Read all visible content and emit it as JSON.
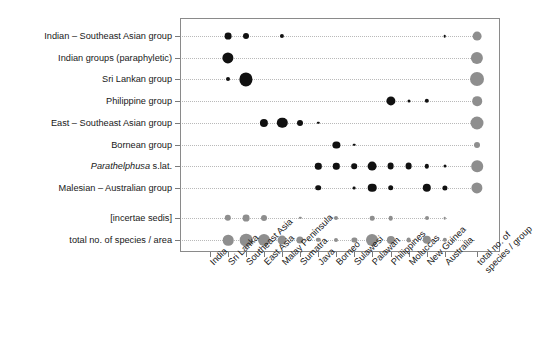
{
  "chart_data": {
    "type": "heatmap",
    "title": "",
    "xlabel": "",
    "ylabel": "",
    "legend_position": "none",
    "grid": true,
    "note": "Bubble (dot) matrix: dot area encodes number of species of each Parathelphusidae group per geographic area. Dark dots = group x area counts; grey dots = marginal totals (rightmost column 'total no. of species / group' and bottom row 'total no. of species / area').",
    "categories": [
      "India",
      "Sri Lanka",
      "Southeast Asia",
      "East Asia",
      "Malay Peninsula",
      "Sumatra",
      "Java",
      "Borneo",
      "Sulawesi",
      "Palawan",
      "Philippines",
      "Moluccas",
      "New Guinea",
      "Australia",
      "total no. of species / group"
    ],
    "rows": [
      "Indian – Southeast Asian group",
      "Indian groups (paraphyletic)",
      "Sri Lankan group",
      "Philippine group",
      "East – Southeast Asian group",
      "Bornean group",
      "Parathelphusa s.lat.",
      "Malesian – Australian group",
      "[incertae sedis]",
      "total no. of species / area"
    ],
    "row_labels_styled": [
      {
        "text": "Indian – Southeast Asian group",
        "italic_prefix": ""
      },
      {
        "text": "Indian groups (paraphyletic)",
        "italic_prefix": ""
      },
      {
        "text": "Sri Lankan group",
        "italic_prefix": ""
      },
      {
        "text": "Philippine group",
        "italic_prefix": ""
      },
      {
        "text": "East – Southeast Asian group",
        "italic_prefix": ""
      },
      {
        "text": "Bornean group",
        "italic_prefix": ""
      },
      {
        "text": "s.lat.",
        "italic_prefix": "Parathelphusa"
      },
      {
        "text": "Malesian – Australian group",
        "italic_prefix": ""
      },
      {
        "text": "[incertae sedis]",
        "italic_prefix": ""
      },
      {
        "text": "total no. of species / area",
        "italic_prefix": ""
      }
    ],
    "series": [
      {
        "name": "Indian – Southeast Asian group",
        "values": [
          0,
          5,
          4,
          0,
          2,
          0,
          0,
          0,
          0,
          0,
          0,
          0,
          0,
          1,
          11
        ]
      },
      {
        "name": "Indian groups (paraphyletic)",
        "values": [
          0,
          12,
          0,
          0,
          0,
          0,
          0,
          0,
          0,
          0,
          0,
          0,
          0,
          0,
          19
        ]
      },
      {
        "name": "Sri Lankan group",
        "values": [
          0,
          2,
          20,
          0,
          0,
          0,
          0,
          0,
          0,
          0,
          0,
          0,
          0,
          0,
          25
        ]
      },
      {
        "name": "Philippine group",
        "values": [
          0,
          0,
          0,
          0,
          0,
          0,
          0,
          0,
          0,
          0,
          11,
          1,
          2,
          0,
          13
        ]
      },
      {
        "name": "East – Southeast Asian group",
        "values": [
          0,
          0,
          0,
          8,
          14,
          4,
          1,
          0,
          0,
          0,
          0,
          0,
          0,
          0,
          22
        ]
      },
      {
        "name": "Bornean group",
        "values": [
          0,
          0,
          0,
          0,
          0,
          0,
          0,
          6,
          1,
          0,
          0,
          0,
          0,
          0,
          5
        ]
      },
      {
        "name": "Parathelphusa s.lat.",
        "values": [
          0,
          0,
          0,
          0,
          0,
          0,
          5,
          5,
          4,
          9,
          6,
          6,
          2,
          1,
          18
        ]
      },
      {
        "name": "Malesian – Australian group",
        "values": [
          0,
          0,
          0,
          0,
          0,
          0,
          4,
          0,
          1,
          6,
          1,
          0,
          10,
          3,
          17
        ]
      },
      {
        "name": "[incertae sedis]",
        "values": [
          0,
          3,
          4,
          3,
          0,
          0,
          0,
          1,
          0,
          2,
          2,
          0,
          2,
          1,
          0
        ]
      },
      {
        "name": "total no. of species / area",
        "values": [
          0,
          11,
          15,
          13,
          8,
          5,
          2,
          2,
          3,
          14,
          9,
          5,
          2,
          8,
          0
        ]
      }
    ],
    "bottom_row_extra": {
      "Borneo_overall": 18,
      "Sulawesi_overall": 7
    },
    "colors": {
      "dark_dot": "#111111",
      "gray_dot": "#8e8e8e",
      "frame": "#8a8a8a",
      "grid": "#b9b9b9",
      "text": "#181818",
      "background": "#ffffff"
    }
  },
  "axis": {
    "column_labels": [
      "India",
      "Sri Lanka",
      "Southeast Asia",
      "East Asia",
      "Malay Peninsula",
      "Sumatra",
      "Java",
      "Borneo",
      "Sulawesi",
      "Palawan",
      "Philippines",
      "Moluccas",
      "New Guinea",
      "Australia"
    ],
    "total_column_label_line1": "total no. of",
    "total_column_label_line2": "species / group"
  },
  "plot_points": {
    "dark": [
      {
        "row": 0,
        "col": 1,
        "r": 3.4
      },
      {
        "row": 0,
        "col": 2,
        "r": 3.0
      },
      {
        "row": 0,
        "col": 4,
        "r": 2.1
      },
      {
        "row": 0,
        "col": 13,
        "r": 1.3
      },
      {
        "row": 1,
        "col": 1,
        "r": 5.6
      },
      {
        "row": 2,
        "col": 1,
        "r": 2.0
      },
      {
        "row": 2,
        "col": 2,
        "r": 6.6
      },
      {
        "row": 3,
        "col": 10,
        "r": 4.6
      },
      {
        "row": 3,
        "col": 11,
        "r": 1.5
      },
      {
        "row": 3,
        "col": 12,
        "r": 2.2
      },
      {
        "row": 4,
        "col": 3,
        "r": 4.1
      },
      {
        "row": 4,
        "col": 4,
        "r": 5.2
      },
      {
        "row": 4,
        "col": 5,
        "r": 3.0
      },
      {
        "row": 4,
        "col": 6,
        "r": 1.2
      },
      {
        "row": 5,
        "col": 7,
        "r": 3.6
      },
      {
        "row": 5,
        "col": 8,
        "r": 1.3
      },
      {
        "row": 6,
        "col": 6,
        "r": 3.2
      },
      {
        "row": 6,
        "col": 7,
        "r": 3.2
      },
      {
        "row": 6,
        "col": 8,
        "r": 2.8
      },
      {
        "row": 6,
        "col": 9,
        "r": 4.4
      },
      {
        "row": 6,
        "col": 10,
        "r": 3.4
      },
      {
        "row": 6,
        "col": 11,
        "r": 3.4
      },
      {
        "row": 6,
        "col": 12,
        "r": 2.2
      },
      {
        "row": 6,
        "col": 13,
        "r": 1.5
      },
      {
        "row": 7,
        "col": 6,
        "r": 2.8
      },
      {
        "row": 7,
        "col": 8,
        "r": 1.4
      },
      {
        "row": 7,
        "col": 9,
        "r": 4.3
      },
      {
        "row": 7,
        "col": 10,
        "r": 2.8
      },
      {
        "row": 7,
        "col": 12,
        "r": 4.2
      },
      {
        "row": 7,
        "col": 13,
        "r": 2.6
      }
    ],
    "gray": [
      {
        "row": 0,
        "col": 14,
        "r": 4.4
      },
      {
        "row": 1,
        "col": 14,
        "r": 6.1
      },
      {
        "row": 2,
        "col": 14,
        "r": 7.0
      },
      {
        "row": 3,
        "col": 14,
        "r": 4.8
      },
      {
        "row": 4,
        "col": 14,
        "r": 6.5
      },
      {
        "row": 5,
        "col": 14,
        "r": 3.0
      },
      {
        "row": 6,
        "col": 14,
        "r": 5.8
      },
      {
        "row": 7,
        "col": 14,
        "r": 5.6
      },
      {
        "row": 8,
        "col": 1,
        "r": 3.2
      },
      {
        "row": 8,
        "col": 2,
        "r": 3.4
      },
      {
        "row": 8,
        "col": 3,
        "r": 3.0
      },
      {
        "row": 8,
        "col": 5,
        "r": 1.2
      },
      {
        "row": 8,
        "col": 7,
        "r": 2.0
      },
      {
        "row": 8,
        "col": 9,
        "r": 2.3
      },
      {
        "row": 8,
        "col": 10,
        "r": 2.3
      },
      {
        "row": 8,
        "col": 12,
        "r": 2.0
      },
      {
        "row": 8,
        "col": 13,
        "r": 1.3
      },
      {
        "row": 9,
        "col": 1,
        "r": 5.3
      },
      {
        "row": 9,
        "col": 2,
        "r": 6.3
      },
      {
        "row": 9,
        "col": 3,
        "r": 6.0
      },
      {
        "row": 9,
        "col": 4,
        "r": 4.4
      },
      {
        "row": 9,
        "col": 5,
        "r": 3.6
      },
      {
        "row": 9,
        "col": 6,
        "r": 2.2
      },
      {
        "row": 9,
        "col": 7,
        "r": 2.0
      },
      {
        "row": 9,
        "col": 8,
        "r": 2.6
      },
      {
        "row": 9,
        "col": 9,
        "r": 6.0
      },
      {
        "row": 9,
        "col": 10,
        "r": 4.1
      },
      {
        "row": 9,
        "col": 11,
        "r": 2.4
      },
      {
        "row": 9,
        "col": 12,
        "r": 4.2
      },
      {
        "row": 9,
        "col": 13,
        "r": 2.2
      },
      {
        "row": 9,
        "col": 14,
        "r": 0.0
      }
    ]
  },
  "geometry": {
    "plot_left": 180,
    "plot_top": 18,
    "plot_right": 500,
    "plot_bottom": 252,
    "col0_x": 210,
    "col_step": 18.05,
    "total_col_x": 477,
    "row0_y": 36,
    "row_step": 21.7,
    "incertae_row_y": 218,
    "total_row_y": 240
  }
}
